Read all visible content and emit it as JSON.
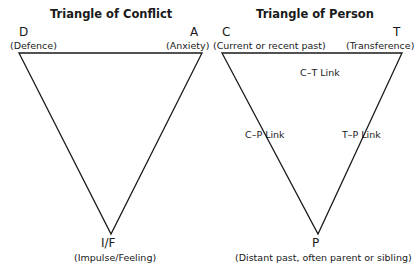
{
  "triangle_of_conflict": {
    "title": "Triangle of Conflict",
    "vertices": {
      "top_left": {
        "label": "D",
        "description": "(Defence)"
      },
      "top_right": {
        "label": "A",
        "description": "(Anxiety)"
      },
      "bottom": {
        "label": "I/F",
        "description": "(Impulse/Feeling)"
      }
    }
  },
  "triangle_of_person": {
    "title": "Triangle of Person",
    "vertices": {
      "top_left": {
        "label": "C",
        "description": "(Current or recent past)"
      },
      "top_right": {
        "label": "T",
        "description": "(Transference)"
      },
      "bottom": {
        "label": "P",
        "description": "(Distant past, often parent or sibling)"
      }
    },
    "links": {
      "top": "C–T Link",
      "left": "C–P Link",
      "right": "T–P Link"
    }
  },
  "colors": {
    "line": "#1a1a1a",
    "background": "#ffffff"
  }
}
